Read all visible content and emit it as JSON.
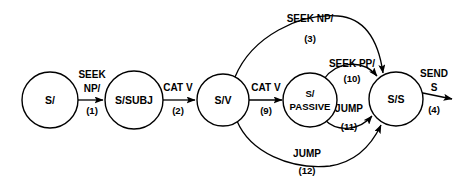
{
  "diagram": {
    "background_color": "#ffffff",
    "stroke_color": "#000000",
    "states": [
      {
        "id": "s-start",
        "label": "S/",
        "label_lines": [
          "S/"
        ],
        "cx": 50,
        "cy": 100,
        "r": 28
      },
      {
        "id": "s-subj",
        "label": "S/SUBJ",
        "label_lines": [
          "S/SUBJ"
        ],
        "cx": 134,
        "cy": 100,
        "r": 29
      },
      {
        "id": "s-v",
        "label": "S/V",
        "label_lines": [
          "S/V"
        ],
        "cx": 223,
        "cy": 100,
        "r": 26
      },
      {
        "id": "s-passive",
        "label": "S/PASSIVE",
        "label_lines": [
          "S/",
          "PASSIVE"
        ],
        "cx": 310,
        "cy": 100,
        "r": 27
      },
      {
        "id": "s-s",
        "label": "S/S",
        "label_lines": [
          "S/S"
        ],
        "cx": 396,
        "cy": 99,
        "r": 27
      }
    ],
    "transitions": [
      {
        "id": "t1",
        "from": "s-start",
        "to": "s-subj",
        "label_lines": [
          "SEEK",
          "NP/"
        ],
        "number": "(1)",
        "label_x": 92,
        "label_y": 78,
        "number_x": 92,
        "number_y": 112
      },
      {
        "id": "t2",
        "from": "s-subj",
        "to": "s-v",
        "label_lines": [
          "CAT  V"
        ],
        "number": "(2)",
        "label_x": 178,
        "label_y": 91,
        "number_x": 178,
        "number_y": 114
      },
      {
        "id": "t9",
        "from": "s-v",
        "to": "s-passive",
        "label_lines": [
          "CAT  V"
        ],
        "number": "(9)",
        "label_x": 266,
        "label_y": 91,
        "number_x": 266,
        "number_y": 114
      },
      {
        "id": "t3",
        "from": "s-v",
        "to": "s-s",
        "label_lines": [
          "SEEK  NP/"
        ],
        "number": "(3)",
        "label_x": 310,
        "label_y": 22,
        "number_x": 310,
        "number_y": 42
      },
      {
        "id": "t10",
        "from": "s-passive",
        "to": "s-s",
        "label_lines": [
          "SEEK  PP/"
        ],
        "number": "(10)",
        "label_x": 352,
        "label_y": 67,
        "number_x": 352,
        "number_y": 82
      },
      {
        "id": "t11",
        "from": "s-passive",
        "to": "s-s",
        "label_lines": [
          "JUMP"
        ],
        "number": "(11)",
        "label_x": 349,
        "label_y": 112,
        "number_x": 349,
        "number_y": 130
      },
      {
        "id": "t12",
        "from": "s-v",
        "to": "s-s",
        "label_lines": [
          "JUMP"
        ],
        "number": "(12)",
        "label_x": 307,
        "label_y": 157,
        "number_x": 307,
        "number_y": 174
      },
      {
        "id": "t4",
        "from": "s-s",
        "to": "exit",
        "label_lines": [
          "SEND",
          "S"
        ],
        "number": "(4)",
        "label_x": 433,
        "label_y": 77,
        "number_x": 433,
        "number_y": 113
      }
    ]
  }
}
